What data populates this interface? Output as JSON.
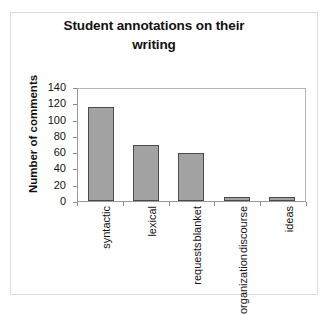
{
  "figure": {
    "title": "Student annotations on their writing",
    "title_line_1": "Student annotations on their",
    "title_line_2": "writing"
  },
  "chart_data": {
    "type": "bar",
    "title": "Student annotations on their writing",
    "xlabel": "",
    "ylabel": "Number of comments",
    "categories": [
      "syntactic",
      "lexical",
      "blanket requests",
      "discourse organization",
      "ideas"
    ],
    "category_lines": [
      [
        "syntactic"
      ],
      [
        "lexical"
      ],
      [
        "blanket",
        "requests"
      ],
      [
        "discourse",
        "organization"
      ],
      [
        "ideas"
      ]
    ],
    "values": [
      116,
      70,
      60,
      5,
      5
    ],
    "ylim": [
      0,
      140
    ],
    "yticks": [
      0,
      20,
      40,
      60,
      80,
      100,
      120,
      140
    ],
    "ytick_labels": [
      "0",
      "20",
      "40",
      "60",
      "80",
      "100",
      "120",
      "140"
    ],
    "grid": false,
    "legend": false,
    "legend_position": "none",
    "bar_fill_color": "#a3a3a3",
    "bar_edge_color": "#4a4a4a",
    "axis_color": "#9a9a9a",
    "background_color": "#ffffff",
    "text_color": "#141414"
  }
}
